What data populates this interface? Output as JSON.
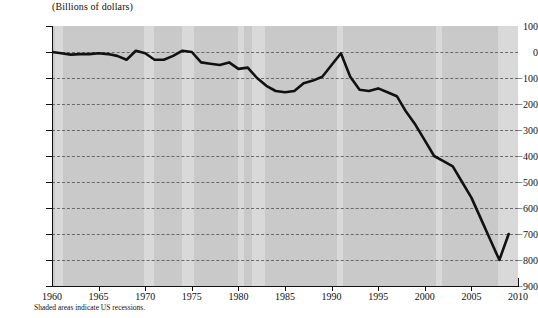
{
  "chart_data": {
    "type": "line",
    "title": "",
    "ylabel": "(Billions of dollars)",
    "xlabel": "",
    "footnote": "Shaded areas indicate US recessions.",
    "ylim": [
      -900,
      100
    ],
    "xlim": [
      1960,
      2010
    ],
    "yticks": [
      100,
      0,
      -100,
      -200,
      -300,
      -400,
      -500,
      -600,
      -700,
      -800,
      -900
    ],
    "ytick_labels": [
      "100",
      "0",
      "−100",
      "−200",
      "−300",
      "−400",
      "−500",
      "−600",
      "−700",
      "−800",
      "−900"
    ],
    "xticks": [
      1960,
      1965,
      1970,
      1975,
      1980,
      1985,
      1990,
      1995,
      2000,
      2005,
      2010
    ],
    "xtick_labels": [
      "1960",
      "1965",
      "1970",
      "1975",
      "1980",
      "1985",
      "1990",
      "1995",
      "2000",
      "2005",
      "2010"
    ],
    "grid": true,
    "legend": "none",
    "series": [
      {
        "name": "Federal budget surplus/deficit",
        "x": [
          1960,
          1961,
          1962,
          1963,
          1964,
          1965,
          1966,
          1967,
          1968,
          1969,
          1970,
          1971,
          1972,
          1973,
          1974,
          1975,
          1976,
          1977,
          1978,
          1979,
          1980,
          1981,
          1982,
          1983,
          1984,
          1985,
          1986,
          1987,
          1988,
          1989,
          1990,
          1991,
          1992,
          1993,
          1994,
          1995,
          1996,
          1997,
          1998,
          1999,
          2000,
          2001,
          2002,
          2003,
          2004,
          2005,
          2006,
          2007,
          2008,
          2009
        ],
        "values": [
          3,
          -3,
          -7,
          -5,
          -6,
          -1,
          -4,
          -9,
          -25,
          3,
          -3,
          -23,
          -23,
          -15,
          -6,
          -53,
          -74,
          -54,
          -59,
          -41,
          -74,
          -79,
          -128,
          -208,
          -185,
          -212,
          -221,
          -150,
          -155,
          -153,
          -221,
          -269,
          -290,
          -255,
          -203,
          -164,
          -107,
          -22,
          69,
          126,
          236,
          128,
          -158,
          -378,
          -413,
          -318,
          -248,
          -161,
          -459,
          -1413
        ],
        "display_values": [
          0,
          -5,
          -10,
          -8,
          -8,
          -5,
          -8,
          -15,
          -30,
          5,
          -5,
          -30,
          -30,
          -15,
          5,
          0,
          -40,
          -45,
          -50,
          -40,
          -65,
          -60,
          -100,
          -130,
          -150,
          -155,
          -150,
          -120,
          -110,
          -95,
          -50,
          -5,
          -95,
          -145,
          -150,
          -140,
          -155,
          -170,
          -230,
          -280,
          -340,
          -400,
          -420,
          -440,
          -500,
          -560,
          -640,
          -720,
          -800,
          -700
        ],
        "color": "#111111",
        "width": 2.6
      }
    ],
    "recessions": [
      {
        "start": 1960.3,
        "end": 1961.2
      },
      {
        "start": 1969.9,
        "end": 1970.9
      },
      {
        "start": 1973.9,
        "end": 1975.2
      },
      {
        "start": 1980.0,
        "end": 1980.6
      },
      {
        "start": 1981.5,
        "end": 1982.9
      },
      {
        "start": 1990.6,
        "end": 1991.2
      },
      {
        "start": 2001.2,
        "end": 2001.9
      },
      {
        "start": 2007.9,
        "end": 2010.0
      }
    ],
    "colors": {
      "plot_background": "#c9c9c9",
      "recession_band": "#d9d9d9",
      "line": "#111111",
      "gridline": "#5a5a5a",
      "axis": "#111111",
      "text": "#111111",
      "page_background": "#ffffff"
    }
  }
}
